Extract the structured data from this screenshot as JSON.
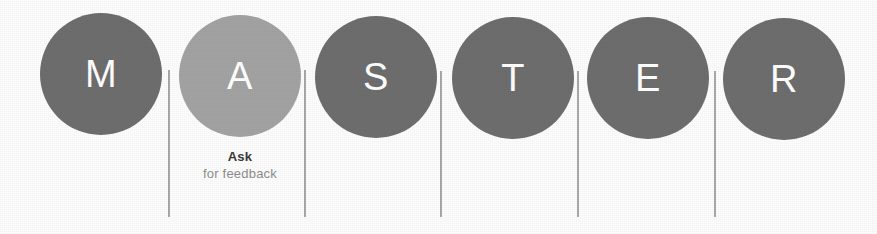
{
  "diagram": {
    "background_color": "#fdfdfd",
    "letter_color": "#ffffff",
    "divider_color": "#9a9a9a",
    "nodes": [
      {
        "letter": "M",
        "color": "#6e6e6e",
        "highlighted": false,
        "caption_title": "",
        "caption_sub": ""
      },
      {
        "letter": "A",
        "color": "#a3a3a3",
        "highlighted": true,
        "caption_title": "Ask",
        "caption_sub": "for feedback"
      },
      {
        "letter": "S",
        "color": "#6e6e6e",
        "highlighted": false,
        "caption_title": "",
        "caption_sub": ""
      },
      {
        "letter": "T",
        "color": "#6e6e6e",
        "highlighted": false,
        "caption_title": "",
        "caption_sub": ""
      },
      {
        "letter": "E",
        "color": "#6e6e6e",
        "highlighted": false,
        "caption_title": "",
        "caption_sub": ""
      },
      {
        "letter": "R",
        "color": "#6e6e6e",
        "highlighted": false,
        "caption_title": "",
        "caption_sub": ""
      }
    ],
    "dividers": [
      {
        "index": 1
      },
      {
        "index": 2
      },
      {
        "index": 3
      },
      {
        "index": 4
      },
      {
        "index": 5
      }
    ]
  }
}
